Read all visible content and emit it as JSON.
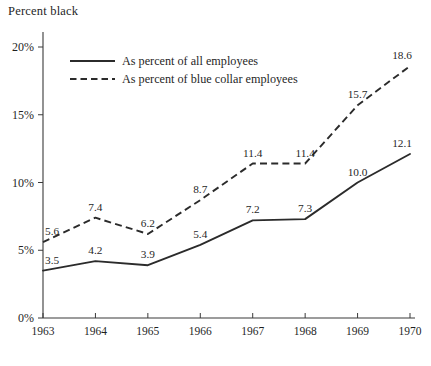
{
  "chart_data": {
    "type": "line",
    "title": "Percent black",
    "xlabel": "",
    "ylabel": "Percent black",
    "categories": [
      "1963",
      "1964",
      "1965",
      "1966",
      "1967",
      "1968",
      "1969",
      "1970"
    ],
    "x": [
      1963,
      1964,
      1965,
      1966,
      1967,
      1968,
      1969,
      1970
    ],
    "xlim": [
      1963,
      1970
    ],
    "ylim": [
      0,
      20
    ],
    "y_ticks": [
      0,
      5,
      10,
      15,
      20
    ],
    "y_tick_labels": [
      "0%",
      "5%",
      "10%",
      "15%",
      "20%"
    ],
    "grid": false,
    "legend_position": "upper-left-inside",
    "series": [
      {
        "name": "As percent of all employees",
        "style": "solid",
        "values": [
          3.5,
          4.2,
          3.9,
          5.4,
          7.2,
          7.3,
          10.0,
          12.1
        ],
        "labels": [
          "3.5",
          "4.2",
          "3.9",
          "5.4",
          "7.2",
          "7.3",
          "10.0",
          "12.1"
        ]
      },
      {
        "name": "As percent of blue collar employees",
        "style": "dashed",
        "values": [
          5.6,
          7.4,
          6.2,
          8.7,
          11.4,
          11.4,
          15.7,
          18.6
        ],
        "labels": [
          "5.6",
          "7.4",
          "6.2",
          "8.7",
          "11.4",
          "11.4",
          "15.7",
          "18.6"
        ]
      }
    ],
    "colors": {
      "line": "#2b2b2b",
      "axis": "#3a3a3a",
      "text": "#1f1f1f",
      "background": "#ffffff"
    }
  },
  "legend": {
    "items": [
      {
        "label": "As percent of all employees",
        "style": "solid"
      },
      {
        "label": "As percent of blue collar employees",
        "style": "dashed"
      }
    ]
  },
  "axes": {
    "y_labels": [
      "20%",
      "15%",
      "10%",
      "5%",
      "0%"
    ],
    "x_labels": [
      "1963",
      "1964",
      "1965",
      "1966",
      "1967",
      "1968",
      "1969",
      "1970"
    ]
  }
}
